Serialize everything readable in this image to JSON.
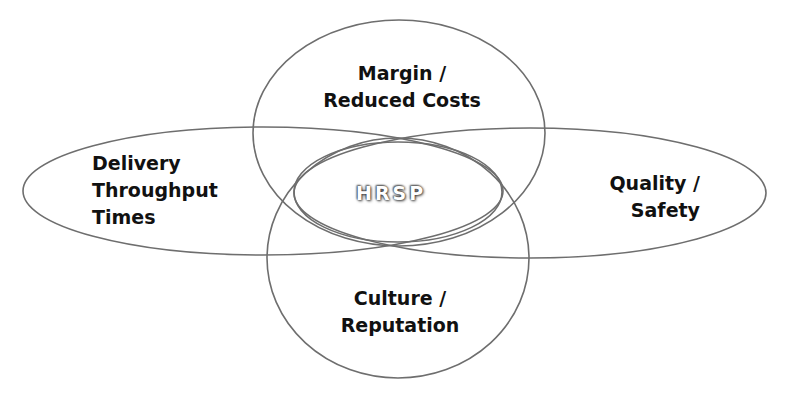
{
  "diagram": {
    "type": "venn",
    "center": {
      "label": "HRSP"
    },
    "circles": [
      {
        "id": "top",
        "lines": [
          "Margin /",
          "Reduced Costs"
        ]
      },
      {
        "id": "left",
        "lines": [
          "Delivery",
          "Throughput",
          "Times"
        ]
      },
      {
        "id": "right",
        "lines": [
          "Quality /",
          "Safety"
        ]
      },
      {
        "id": "bottom",
        "lines": [
          "Culture /",
          "Reputation"
        ]
      }
    ],
    "colors": {
      "stroke": "#6e6e6e",
      "text": "#111111",
      "center_text": "#ffffff",
      "center_shadow": "#333333",
      "background": "#ffffff"
    }
  }
}
